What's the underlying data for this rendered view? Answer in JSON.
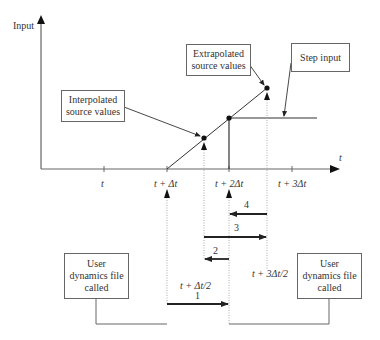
{
  "axes": {
    "y_label": "Input",
    "x_label": "t"
  },
  "ticks": [
    {
      "label": "t",
      "x": 104
    },
    {
      "label": "t + Δt",
      "x": 167
    },
    {
      "label": "t + 2Δt",
      "x": 229
    },
    {
      "label": "t + 3Δt",
      "x": 292
    }
  ],
  "callouts": {
    "interpolated": {
      "line1": "Interpolated",
      "line2": "source values"
    },
    "extrapolated": {
      "line1": "Extrapolated",
      "line2": "source values"
    },
    "step": "Step input"
  },
  "mid_labels": {
    "half_step": "t + Δt/2",
    "three_half_step": "t + 3Δt/2"
  },
  "sequence_arrows": [
    {
      "label": "1",
      "from": "t + Δt",
      "to": "t + 2Δt"
    },
    {
      "label": "2",
      "from": "t + 2Δt",
      "to": "t + Δt/2"
    },
    {
      "label": "3",
      "from": "t + Δt/2",
      "to": "t + 3Δt/2"
    },
    {
      "label": "4",
      "from": "t + 3Δt/2",
      "to": "t + 2Δt"
    }
  ],
  "boxes": {
    "left": {
      "line1": "User",
      "line2": "dynamics file",
      "line3": "called"
    },
    "right": {
      "line1": "User",
      "line2": "dynamics file",
      "line3": "called"
    }
  }
}
